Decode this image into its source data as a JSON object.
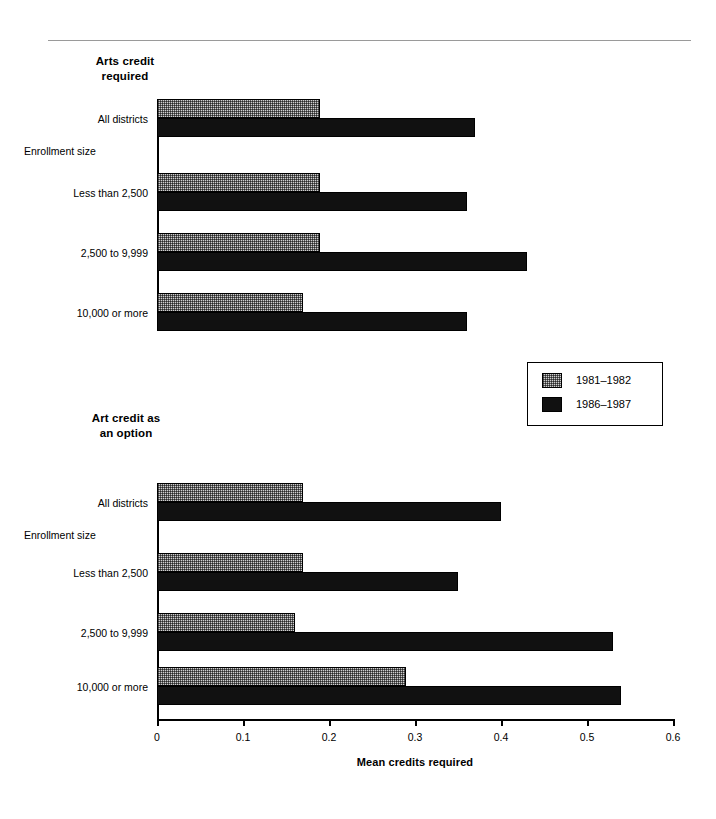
{
  "chart_data": [
    {
      "type": "bar",
      "orientation": "horizontal",
      "title": "Arts credit\nrequired",
      "xlabel": "",
      "ylabel": "",
      "xlim": [
        0,
        0.6
      ],
      "xticks": [
        "0",
        "0.1",
        "0.2",
        "0.3",
        "0.4",
        "0.5",
        "0.6"
      ],
      "grid": false,
      "axis_visible": false,
      "categories": [
        "All districts",
        "Enrollment size",
        "Less than 2,500",
        "2,500 to 9,999",
        "10,000 or more"
      ],
      "group_header_index": 1,
      "series": [
        {
          "name": "1981–1982",
          "values": [
            0.19,
            null,
            0.19,
            0.19,
            0.17
          ]
        },
        {
          "name": "1986–1987",
          "values": [
            0.37,
            null,
            0.36,
            0.43,
            0.36
          ]
        }
      ]
    },
    {
      "type": "bar",
      "orientation": "horizontal",
      "title": "Art credit as\nan option",
      "xlabel": "Mean credits required",
      "ylabel": "",
      "xlim": [
        0,
        0.6
      ],
      "xticks": [
        "0",
        "0.1",
        "0.2",
        "0.3",
        "0.4",
        "0.5",
        "0.6"
      ],
      "grid": false,
      "axis_visible": true,
      "categories": [
        "All districts",
        "Enrollment size",
        "Less than 2,500",
        "2,500 to 9,999",
        "10,000 or more"
      ],
      "group_header_index": 1,
      "series": [
        {
          "name": "1981–1982",
          "values": [
            0.17,
            null,
            0.17,
            0.16,
            0.29
          ]
        },
        {
          "name": "1986–1987",
          "values": [
            0.4,
            null,
            0.35,
            0.53,
            0.54
          ]
        }
      ]
    }
  ],
  "legend": {
    "entries": [
      {
        "label": "1981–1982",
        "swatch": "stippled-gray",
        "color": "#cfcfcf"
      },
      {
        "label": "1986–1987",
        "swatch": "solid-black",
        "color": "#111111"
      }
    ]
  },
  "axis": {
    "title": "Mean credits required",
    "ticks": [
      "0",
      "0.1",
      "0.2",
      "0.3",
      "0.4",
      "0.5",
      "0.6"
    ]
  },
  "panels": {
    "top": {
      "title": "Arts credit\nrequired",
      "rows": [
        {
          "label": "All districts",
          "align": "right",
          "old": 0.19,
          "new": 0.37
        },
        {
          "label": "Enrollment size",
          "align": "left",
          "old": null,
          "new": null
        },
        {
          "label": "Less than 2,500",
          "align": "right",
          "old": 0.19,
          "new": 0.36
        },
        {
          "label": "2,500 to 9,999",
          "align": "right",
          "old": 0.19,
          "new": 0.43
        },
        {
          "label": "10,000 or more",
          "align": "right",
          "old": 0.17,
          "new": 0.36
        }
      ]
    },
    "bottom": {
      "title": "Art credit as\nan option",
      "rows": [
        {
          "label": "All districts",
          "align": "right",
          "old": 0.17,
          "new": 0.4
        },
        {
          "label": "Enrollment size",
          "align": "left",
          "old": null,
          "new": null
        },
        {
          "label": "Less than 2,500",
          "align": "right",
          "old": 0.17,
          "new": 0.35
        },
        {
          "label": "2,500 to 9,999",
          "align": "right",
          "old": 0.16,
          "new": 0.53
        },
        {
          "label": "10,000 or more",
          "align": "right",
          "old": 0.29,
          "new": 0.54
        }
      ]
    }
  }
}
